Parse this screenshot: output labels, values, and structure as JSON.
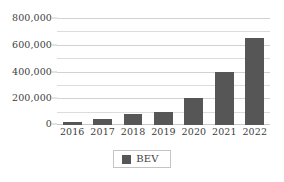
{
  "chart_data": {
    "type": "bar",
    "title": "",
    "subtitle": "",
    "xlabel": "",
    "ylabel": "",
    "categories": [
      "2016",
      "2017",
      "2018",
      "2019",
      "2020",
      "2021",
      "2022"
    ],
    "series": [
      {
        "name": "BEV",
        "color": "#565656",
        "values": [
          25000,
          45000,
          80000,
          100000,
          200000,
          400000,
          650000
        ]
      }
    ],
    "ylim": [
      0,
      800000
    ],
    "y_major_ticks": [
      0,
      200000,
      400000,
      600000,
      800000
    ],
    "y_major_tick_labels": [
      "0",
      "200,000",
      "400,000",
      "600,000",
      "800,000"
    ],
    "y_minor_ticks": [
      100000,
      300000,
      500000,
      700000
    ],
    "grid": true,
    "grid_axis": "y",
    "legend": {
      "position": "bottom",
      "entries": [
        {
          "label": "BEV",
          "color": "#565656"
        }
      ]
    },
    "style": {
      "background": "#ffffff",
      "gridline_color": "#dcdcdc",
      "text_color": "#3d3d3d",
      "legend_border_color": "#c4c4c4"
    }
  }
}
